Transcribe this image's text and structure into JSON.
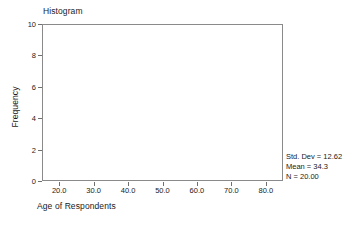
{
  "chart_data": {
    "type": "bar",
    "title": "Histogram",
    "xlabel": "Age of Respondents",
    "ylabel": "Frequency",
    "xlim": [
      15,
      85
    ],
    "ylim": [
      0,
      10
    ],
    "grid": false,
    "legend": null,
    "x_ticks": [
      "20.0",
      "30.0",
      "40.0",
      "50.0",
      "60.0",
      "70.0",
      "80.0"
    ],
    "x_tick_values": [
      20,
      30,
      40,
      50,
      60,
      70,
      80
    ],
    "y_ticks": [
      "0",
      "2",
      "4",
      "6",
      "8",
      "10"
    ],
    "y_tick_values": [
      0,
      2,
      4,
      6,
      8,
      10
    ],
    "categories": [],
    "values": [],
    "bars": [],
    "annotations": [
      "Std. Dev = 12.62",
      "Mean = 34.3",
      "N = 20.00"
    ]
  },
  "stats": {
    "std_dev": "Std. Dev = 12.62",
    "mean": "Mean = 34.3",
    "n": "N = 20.00"
  },
  "colors": {
    "frame": "#8a8a8a",
    "tick": "#6f6f6f",
    "text": "#1a1a1a",
    "background": "#ffffff"
  }
}
